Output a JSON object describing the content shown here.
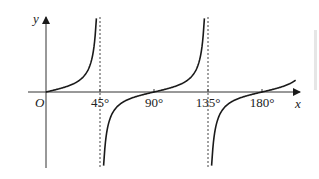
{
  "chart_data": {
    "type": "line",
    "title": "",
    "function": "y = tan 2x",
    "xlabel": "x",
    "ylabel": "y",
    "origin_label": "O",
    "x_ticks": [
      {
        "value": 45,
        "label": "45°"
      },
      {
        "value": 90,
        "label": "90°"
      },
      {
        "value": 135,
        "label": "135°"
      },
      {
        "value": 180,
        "label": "180°"
      }
    ],
    "asymptotes": [
      45,
      135
    ],
    "xlim": [
      -15,
      210
    ],
    "grid": false,
    "series": [
      {
        "name": "branch-1",
        "x_range": [
          0,
          42
        ],
        "description": "rises from 0 toward +∞ at 45°"
      },
      {
        "name": "branch-2",
        "x_range": [
          48,
          132
        ],
        "description": "from -∞ after 45°, through 0 at 90°, toward +∞ at 135°"
      },
      {
        "name": "branch-3",
        "x_range": [
          138,
          208
        ],
        "description": "from -∞ after 135°, through 0 at 180°, continuing upward"
      }
    ],
    "zeros": [
      0,
      90,
      180
    ],
    "line_color": "#1a1a1a",
    "asymptote_style": "dashed"
  }
}
